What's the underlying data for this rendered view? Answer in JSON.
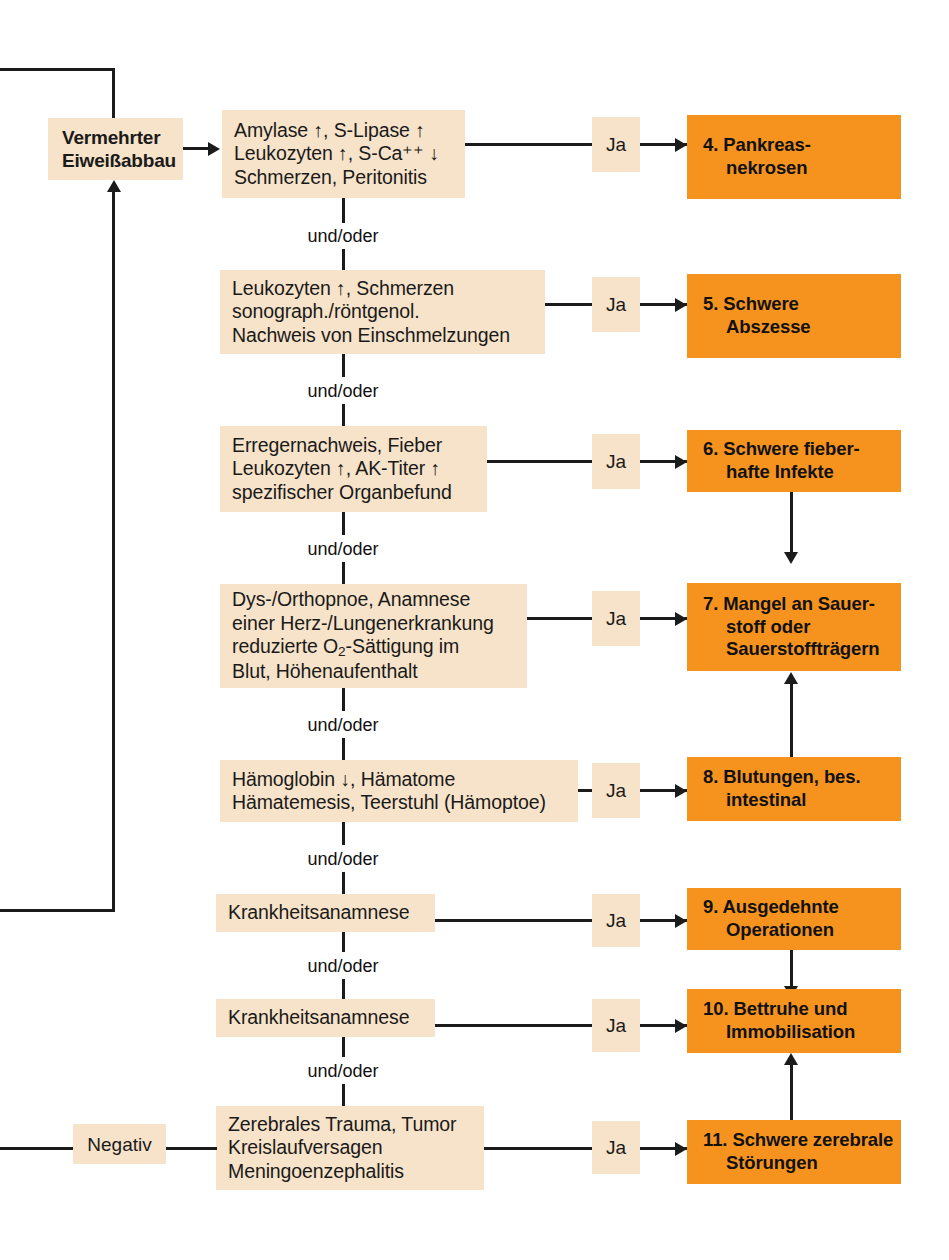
{
  "diagram": {
    "colors": {
      "criteria_box": "#F7E3C9",
      "result_box": "#F6931E",
      "line": "#1B1B1B",
      "text": "#111111",
      "background": "#FFFFFF"
    },
    "start_node": {
      "line1": "Vermehrter",
      "line2": "Eiweißabbau"
    },
    "negative_node": {
      "label": "Negativ"
    },
    "connector_label": "und/oder",
    "yes_label": "Ja",
    "rows": [
      {
        "id": "row-4",
        "criteria": [
          "Amylase ↑, S-Lipase ↑",
          "Leukozyten ↑, S-Ca⁺⁺ ↓",
          "Schmerzen, Peritonitis"
        ],
        "yes": "Ja",
        "result": [
          "4. Pankreas-",
          "nekrosen"
        ],
        "result_indent": [
          false,
          true
        ]
      },
      {
        "id": "row-5",
        "criteria": [
          "Leukozyten ↑, Schmerzen",
          "sonograph./röntgenol.",
          "Nachweis von Einschmelzungen"
        ],
        "yes": "Ja",
        "result": [
          "5. Schwere",
          "Abszesse"
        ],
        "result_indent": [
          false,
          true
        ]
      },
      {
        "id": "row-6",
        "criteria": [
          "Erregernachweis, Fieber",
          "Leukozyten ↑, AK-Titer ↑",
          "spezifischer Organbefund"
        ],
        "yes": "Ja",
        "result": [
          "6. Schwere fieber-",
          "hafte Infekte"
        ],
        "result_indent": [
          false,
          true
        ]
      },
      {
        "id": "row-7",
        "criteria": [
          "Dys-/Orthopnoe, Anamnese",
          "einer Herz-/Lungenerkrankung",
          "reduzierte O₂-Sättigung im",
          "Blut, Höhenaufenthalt"
        ],
        "yes": "Ja",
        "result": [
          "7. Mangel an Sauer-",
          "stoff oder",
          "Sauerstoffträgern"
        ],
        "result_indent": [
          false,
          true,
          true
        ]
      },
      {
        "id": "row-8",
        "criteria": [
          "Hämoglobin ↓, Hämatome",
          "Hämatemesis, Teerstuhl (Hämoptoe)"
        ],
        "yes": "Ja",
        "result": [
          "8. Blutungen, bes.",
          "intestinal"
        ],
        "result_indent": [
          false,
          true
        ]
      },
      {
        "id": "row-9",
        "criteria": [
          "Krankheitsanamnese"
        ],
        "yes": "Ja",
        "result": [
          "9. Ausgedehnte",
          "Operationen"
        ],
        "result_indent": [
          false,
          true
        ]
      },
      {
        "id": "row-10",
        "criteria": [
          "Krankheitsanamnese"
        ],
        "yes": "Ja",
        "result": [
          "10. Bettruhe und",
          "Immobilisation"
        ],
        "result_indent": [
          false,
          true
        ]
      },
      {
        "id": "row-11",
        "criteria": [
          "Zerebrales Trauma, Tumor",
          "Kreislaufversagen",
          "Meningoenzephalitis"
        ],
        "yes": "Ja",
        "result": [
          "11. Schwere zerebrale",
          "Störungen"
        ],
        "result_indent": [
          false,
          true
        ]
      }
    ]
  }
}
